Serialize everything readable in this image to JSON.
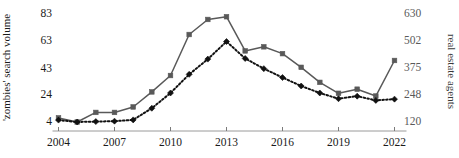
{
  "chart_data": {
    "type": "line",
    "title": "",
    "xlabel": "",
    "ylabel": "'zombies' search volume",
    "y2label": "real estate agents",
    "x": [
      2004,
      2005,
      2006,
      2007,
      2008,
      2009,
      2010,
      2011,
      2012,
      2013,
      2014,
      2015,
      2016,
      2017,
      2018,
      2019,
      2020,
      2021,
      2022
    ],
    "xlim": [
      2004,
      2022
    ],
    "xticks": [
      2004,
      2007,
      2010,
      2013,
      2016,
      2019,
      2022
    ],
    "xticklabels": [
      "2004",
      "2007",
      "2010",
      "2013",
      "2016",
      "2019",
      "2022"
    ],
    "ylim": [
      4,
      83
    ],
    "yticks": [
      4,
      24,
      43,
      63,
      83
    ],
    "yticklabels": [
      "4",
      "24",
      "43",
      "63",
      "83"
    ],
    "y2lim": [
      120,
      630
    ],
    "y2ticks": [
      120,
      248,
      375,
      502,
      630
    ],
    "y2ticklabels": [
      "120",
      "248",
      "375",
      "502",
      "630"
    ],
    "grid": false,
    "legend": "none",
    "series": [
      {
        "name": "'zombies' search volume",
        "axis": "left",
        "color": "#595959",
        "marker": "square",
        "linestyle": "solid",
        "values": [
          7,
          4,
          11,
          11,
          15,
          26,
          38,
          68,
          79,
          81,
          56,
          59,
          54,
          44,
          33,
          25,
          28,
          23,
          49
        ]
      },
      {
        "name": "real estate agents",
        "axis": "right",
        "color": "#111111",
        "marker": "diamond",
        "linestyle": "dotted",
        "values": [
          129,
          120,
          122,
          124,
          130,
          185,
          257,
          345,
          417,
          500,
          420,
          372,
          330,
          290,
          257,
          230,
          242,
          222,
          228
        ]
      }
    ]
  },
  "axes": {
    "left_title": "'zombies' search volume",
    "right_title": "real estate agents"
  }
}
